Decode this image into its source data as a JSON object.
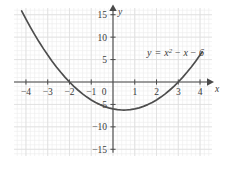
{
  "chart_data": {
    "type": "line",
    "title": "",
    "subtitle": "",
    "xlabel": "x",
    "ylabel": "y",
    "equation": "y = x² − x − 6",
    "equation_parts": {
      "lhs": "y",
      "equals": "=",
      "term1_base": "x",
      "term1_exp": "2",
      "term2": "− x",
      "term3": "− 6"
    },
    "function": "x^2 - x - 6",
    "xlim": [
      -4.55,
      4.55
    ],
    "ylim": [
      -16.5,
      16.5
    ],
    "xticks": [
      -4,
      -3,
      -2,
      -1,
      0,
      1,
      2,
      3,
      4
    ],
    "xtick_labels": [
      "−4",
      "−3",
      "−2",
      "−1",
      "0",
      "1",
      "2",
      "3",
      "4"
    ],
    "yticks": [
      15,
      10,
      5,
      -5,
      -10,
      -15
    ],
    "ytick_labels": [
      "15",
      "10",
      "5",
      "−5",
      "−10",
      "−15"
    ],
    "grid": true,
    "grid_minor": true,
    "grid_major_step": 1,
    "grid_minor_step": 0.2,
    "legend": "none",
    "axis_arrows": true,
    "roots": [
      -2,
      3
    ],
    "vertex": [
      0.5,
      -6.25
    ],
    "y_intercept": -6,
    "curve_x_start": -4.2,
    "curve_x_end": 4.1,
    "series": [
      {
        "name": "y = x² − x − 6",
        "x": [
          -4.2,
          -4.0,
          -3.8,
          -3.6,
          -3.4,
          -3.2,
          -3.0,
          -2.8,
          -2.6,
          -2.4,
          -2.2,
          -2.0,
          -1.8,
          -1.6,
          -1.4,
          -1.2,
          -1.0,
          -0.8,
          -0.6,
          -0.4,
          -0.2,
          0.0,
          0.2,
          0.4,
          0.5,
          0.6,
          0.8,
          1.0,
          1.2,
          1.4,
          1.6,
          1.8,
          2.0,
          2.2,
          2.4,
          2.6,
          2.8,
          3.0,
          3.2,
          3.4,
          3.6,
          3.8,
          4.0,
          4.1
        ],
        "y": [
          15.84,
          14.0,
          12.24,
          10.56,
          8.96,
          7.44,
          6.0,
          4.64,
          3.36,
          2.16,
          1.04,
          0.0,
          -0.96,
          -1.84,
          -2.64,
          -3.36,
          -4.0,
          -4.56,
          -5.04,
          -5.44,
          -5.76,
          -6.0,
          -6.16,
          -6.24,
          -6.25,
          -6.24,
          -6.16,
          -6.0,
          -5.76,
          -5.44,
          -5.04,
          -4.56,
          -4.0,
          -3.36,
          -2.64,
          -1.84,
          -0.96,
          0.0,
          1.04,
          2.16,
          3.36,
          4.64,
          6.0,
          6.71
        ]
      }
    ]
  },
  "style": {
    "curve_color": "#4d4d4d",
    "axis_color": "#4a4a4a",
    "grid_minor_color": "#ebebeb",
    "grid_major_color": "#dcdcdc",
    "text_color": "#3a3a3a",
    "background": "#ffffff"
  }
}
